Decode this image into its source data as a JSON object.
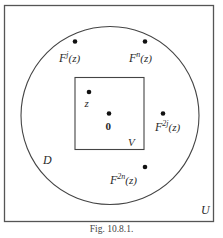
{
  "figure": {
    "caption": "Fig. 10.8.1.",
    "outer_set_label": "U",
    "disc_label": "D",
    "inner_square_label": "V",
    "points": [
      {
        "id": "z",
        "label": "z",
        "sup": ""
      },
      {
        "id": "origin",
        "label": "0",
        "sup": ""
      },
      {
        "id": "Fj",
        "label_base": "F",
        "sup": "j",
        "arg": "(z)"
      },
      {
        "id": "Fn",
        "label_base": "F",
        "sup": "n",
        "arg": "(z)"
      },
      {
        "id": "F2j",
        "label_base": "F",
        "sup": "2j",
        "arg": "(z)"
      },
      {
        "id": "F2n",
        "label_base": "F",
        "sup": "2n",
        "arg": "(z)"
      }
    ]
  }
}
